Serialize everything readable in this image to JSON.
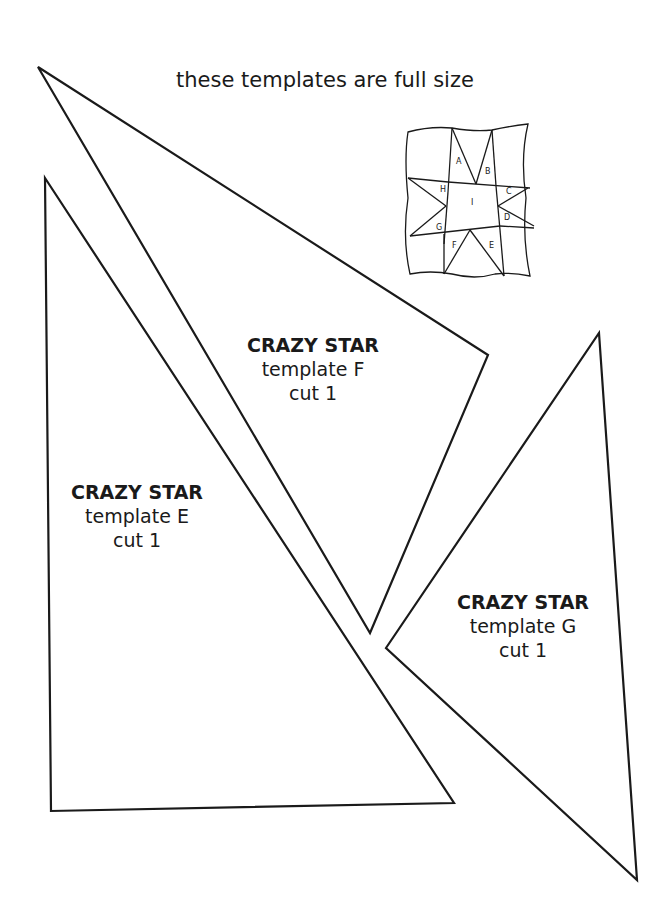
{
  "header": {
    "text": "these templates are full size"
  },
  "templates": {
    "f": {
      "title": "CRAZY STAR",
      "subtitle": "template F",
      "cut": "cut 1"
    },
    "e": {
      "title": "CRAZY STAR",
      "subtitle": "template E",
      "cut": "cut 1"
    },
    "g": {
      "title": "CRAZY STAR",
      "subtitle": "template G",
      "cut": "cut 1"
    }
  },
  "block_diagram": {
    "pieces": [
      "A",
      "B",
      "C",
      "D",
      "E",
      "F",
      "G",
      "H",
      "I"
    ]
  },
  "colors": {
    "line": "#1a1a1a",
    "background": "#ffffff"
  }
}
